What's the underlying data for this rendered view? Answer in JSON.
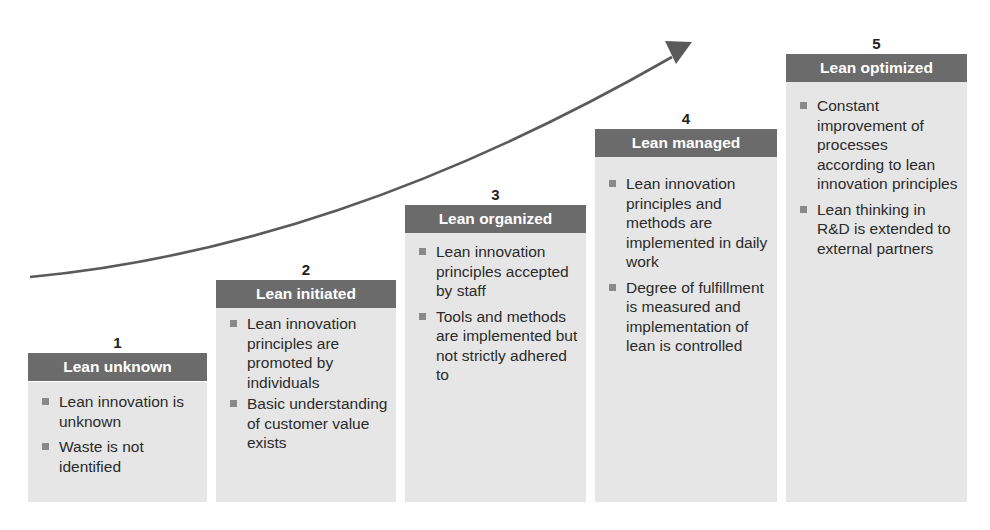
{
  "diagram": {
    "type": "maturity-staircase",
    "arrow": {
      "direction": "up-right",
      "color": "#5a5a5a"
    },
    "colors": {
      "header_bg": "#6b6b6b",
      "header_text": "#ffffff",
      "body_bg": "#e6e6e6",
      "bullet": "#8a8a8a"
    },
    "stages": [
      {
        "number": "1",
        "title": "Lean unknown",
        "bullets": [
          "Lean innovation is unknown",
          "Waste is not identified"
        ]
      },
      {
        "number": "2",
        "title": "Lean initiated",
        "bullets": [
          "Lean innovation principles are promoted by individuals",
          "Basic understanding of customer value exists"
        ]
      },
      {
        "number": "3",
        "title": "Lean organized",
        "bullets": [
          "Lean innovation principles accepted by staff",
          "Tools and methods are implemented but not strictly adhered to"
        ]
      },
      {
        "number": "4",
        "title": "Lean managed",
        "bullets": [
          "Lean innovation principles and methods are implemented in daily work",
          "Degree of fulfillment is measured and implementation of lean is controlled"
        ]
      },
      {
        "number": "5",
        "title": "Lean optimized",
        "bullets": [
          "Constant improvement of processes according to lean innovation principles",
          "Lean thinking in R&D is extended to external partners"
        ]
      }
    ]
  }
}
